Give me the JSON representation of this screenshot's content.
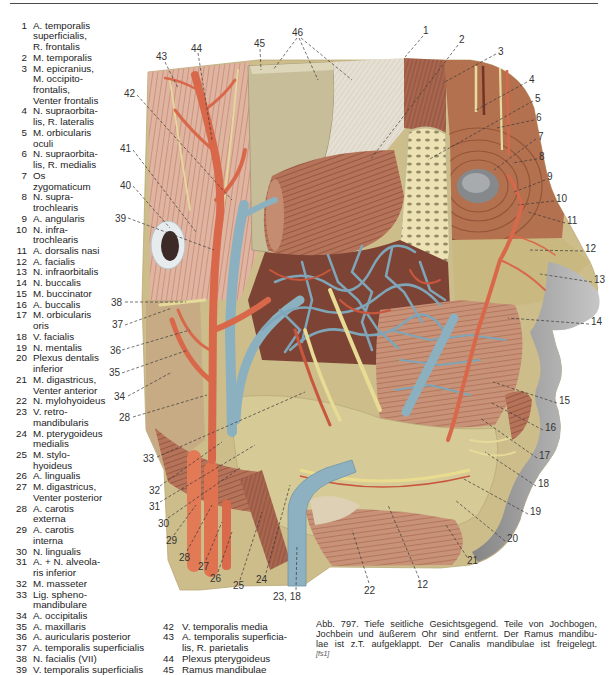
{
  "legend_left": [
    {
      "num": "1",
      "text": "A. temporalis\nsuperficialis,\nR. frontalis"
    },
    {
      "num": "2",
      "text": "M. temporalis"
    },
    {
      "num": "3",
      "text": "M. epicranius,\nM. occipito-\nfrontalis,\nVenter frontalis"
    },
    {
      "num": "4",
      "text": "N. supraorbita-\nlis, R. lateralis"
    },
    {
      "num": "5",
      "text": "M. orbicularis\noculi"
    },
    {
      "num": "6",
      "text": "N. supraorbita-\nlis, R. medialis"
    },
    {
      "num": "7",
      "text": "Os\nzygomaticum"
    },
    {
      "num": "8",
      "text": "N. supra-\ntrochlearis"
    },
    {
      "num": "9",
      "text": "A. angularis"
    },
    {
      "num": "10",
      "text": "N. infra-\ntrochlearis"
    },
    {
      "num": "11",
      "text": "A. dorsalis nasi"
    },
    {
      "num": "12",
      "text": "A. facialis"
    },
    {
      "num": "13",
      "text": "N. infraorbitalis"
    },
    {
      "num": "14",
      "text": "N. buccalis"
    },
    {
      "num": "15",
      "text": "M. buccinator"
    },
    {
      "num": "16",
      "text": "A. buccalis"
    },
    {
      "num": "17",
      "text": "M. orbicularis\noris"
    },
    {
      "num": "18",
      "text": "V. facialis"
    },
    {
      "num": "19",
      "text": "N. mentalis"
    },
    {
      "num": "20",
      "text": "Plexus dentalis\ninferior"
    },
    {
      "num": "21",
      "text": "M. digastricus,\nVenter anterior"
    },
    {
      "num": "22",
      "text": "N. mylohyoideus"
    },
    {
      "num": "23",
      "text": "V. retro-\nmandibularis"
    },
    {
      "num": "24",
      "text": "M. pterygoideus\nmedialis"
    },
    {
      "num": "25",
      "text": "M. stylo-\nhyoideus"
    },
    {
      "num": "26",
      "text": "A. lingualis"
    },
    {
      "num": "27",
      "text": "M. digastricus,\nVenter posterior"
    },
    {
      "num": "28",
      "text": "A. carotis\nexterna"
    },
    {
      "num": "29",
      "text": "A. carotis\ninterna"
    },
    {
      "num": "30",
      "text": "N. lingualis"
    },
    {
      "num": "31",
      "text": "A. + N. alveola-\nris inferior"
    },
    {
      "num": "32",
      "text": "M. masseter"
    },
    {
      "num": "33",
      "text": "Lig. spheno-\nmandibulare"
    },
    {
      "num": "34",
      "text": "A. occipitalis"
    },
    {
      "num": "35",
      "text": "A. maxillaris"
    },
    {
      "num": "36",
      "text": "A. auricularis posterior"
    },
    {
      "num": "37",
      "text": "A. temporalis superficialis"
    },
    {
      "num": "38",
      "text": "N. facialis (VII)"
    },
    {
      "num": "39",
      "text": "V. temporalis superficialis"
    }
  ],
  "legend_bottom": [
    {
      "num": "42",
      "text": "V. temporalis media"
    },
    {
      "num": "43",
      "text": "A. temporalis superficia-\nlis, R. parietalis"
    },
    {
      "num": "44",
      "text": "Plexus pterygoideus"
    },
    {
      "num": "45",
      "text": "Ramus mandibulae"
    }
  ],
  "caption": {
    "lines": [
      "Abb. 797. Tiefe seitliche Gesichtsgegend. Teile von Jochbogen,",
      "Jochbein und äußerem Ohr sind entfernt. Der Ramus mandibu-",
      "lae ist z.T. aufgeklappt. Der Canalis mandibulae ist freigelegt."
    ],
    "tag": "[fs1]"
  },
  "figure": {
    "labels": [
      "1",
      "2",
      "3",
      "4",
      "5",
      "6",
      "7",
      "8",
      "9",
      "10",
      "11",
      "12",
      "13",
      "14",
      "15",
      "16",
      "17",
      "18",
      "19",
      "20",
      "21",
      "12",
      "22",
      "23, 18",
      "24",
      "25",
      "26",
      "27",
      "28",
      "29",
      "30",
      "31",
      "32",
      "33",
      "28",
      "34",
      "35",
      "36",
      "37",
      "38",
      "39",
      "40",
      "41",
      "42",
      "43",
      "44",
      "45",
      "46"
    ],
    "colors": {
      "artery": "#d9684b",
      "vein": "#8bb0c0",
      "nerve": "#e6da9a",
      "muscle": "#b5735a",
      "bone": "#c7be99"
    }
  }
}
